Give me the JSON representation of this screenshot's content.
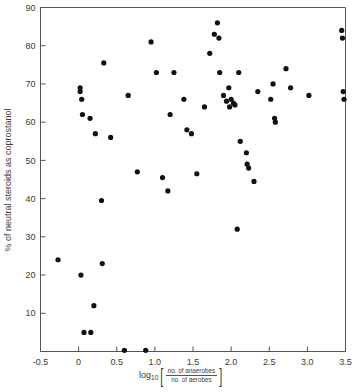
{
  "chart_data": {
    "type": "scatter",
    "title": "",
    "xlabel": "log10[ no. of anaerobes / no. of aerobes ]",
    "ylabel": "% of neutral steroids as coprostanol",
    "xlim": [
      -0.5,
      3.5
    ],
    "ylim": [
      0,
      90
    ],
    "xticks": [
      -0.5,
      0,
      0.5,
      1.0,
      1.5,
      2.0,
      2.5,
      3.0,
      3.5
    ],
    "xticklabels": [
      "-0.5",
      "0",
      "0.5",
      "1.0",
      "1.5",
      "2.0",
      "2.5",
      "3.0",
      "3.5"
    ],
    "yticks": [
      10,
      20,
      30,
      40,
      50,
      60,
      70,
      80,
      90
    ],
    "yticklabels": [
      "10",
      "20",
      "30",
      "40",
      "50",
      "60",
      "70",
      "80",
      "90"
    ],
    "grid": false,
    "legend": null,
    "marker": "filled-circle",
    "marker_color": "#111111",
    "points": [
      [
        -0.27,
        24
      ],
      [
        0.02,
        69
      ],
      [
        0.02,
        68
      ],
      [
        0.03,
        20
      ],
      [
        0.04,
        66
      ],
      [
        0.05,
        62
      ],
      [
        0.07,
        5
      ],
      [
        0.15,
        61
      ],
      [
        0.16,
        5
      ],
      [
        0.2,
        12
      ],
      [
        0.22,
        57
      ],
      [
        0.3,
        39.5
      ],
      [
        0.31,
        23
      ],
      [
        0.33,
        75.5
      ],
      [
        0.42,
        56
      ],
      [
        0.6,
        0.3
      ],
      [
        0.65,
        67
      ],
      [
        0.77,
        47
      ],
      [
        0.88,
        0.3
      ],
      [
        0.95,
        81
      ],
      [
        1.02,
        73
      ],
      [
        1.1,
        45.5
      ],
      [
        1.17,
        42
      ],
      [
        1.2,
        62
      ],
      [
        1.25,
        73
      ],
      [
        1.38,
        66
      ],
      [
        1.42,
        58
      ],
      [
        1.48,
        57
      ],
      [
        1.55,
        46.5
      ],
      [
        1.65,
        64
      ],
      [
        1.72,
        78
      ],
      [
        1.78,
        83
      ],
      [
        1.82,
        86
      ],
      [
        1.84,
        82
      ],
      [
        1.85,
        73
      ],
      [
        1.9,
        67
      ],
      [
        1.94,
        65.5
      ],
      [
        1.97,
        69
      ],
      [
        1.98,
        64
      ],
      [
        2.0,
        66
      ],
      [
        2.03,
        65
      ],
      [
        2.05,
        64.5
      ],
      [
        2.08,
        32
      ],
      [
        2.1,
        73
      ],
      [
        2.12,
        55
      ],
      [
        2.2,
        52
      ],
      [
        2.21,
        49
      ],
      [
        2.23,
        48
      ],
      [
        2.3,
        44.5
      ],
      [
        2.35,
        68
      ],
      [
        2.52,
        66
      ],
      [
        2.55,
        70
      ],
      [
        2.57,
        61
      ],
      [
        2.58,
        60
      ],
      [
        2.72,
        74
      ],
      [
        2.78,
        69
      ],
      [
        3.02,
        67
      ],
      [
        3.45,
        84
      ],
      [
        3.46,
        82
      ],
      [
        3.47,
        68
      ],
      [
        3.48,
        66
      ]
    ]
  },
  "axis": {
    "xlabel_prefix": "log",
    "xlabel_subscript": "10",
    "xlabel_numerator": "no. of anaerobes",
    "xlabel_denominator": "no. of aerobes",
    "bracket_open": "[",
    "bracket_close": "]"
  }
}
